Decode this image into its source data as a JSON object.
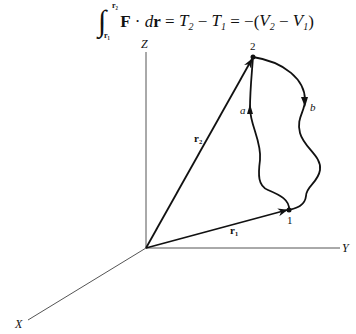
{
  "equation": {
    "integral_symbol": "∫",
    "upper_limit": "r₂",
    "lower_limit": "r₁",
    "integrand_F": "F",
    "dot": " · ",
    "d": "d",
    "integrand_r": "r",
    "eq1": " = ",
    "T2": "T",
    "T2_sub": "2",
    "minus1": " − ",
    "T1": "T",
    "T1_sub": "1",
    "eq2": " = −(",
    "V2": "V",
    "V2_sub": "2",
    "minus2": " − ",
    "V1": "V",
    "V1_sub": "1",
    "close": ")"
  },
  "diagram": {
    "axes": {
      "x_label": "X",
      "y_label": "Y",
      "z_label": "Z"
    },
    "vectors": {
      "r1_label": "r₁",
      "r2_label": "r₂"
    },
    "points": {
      "p1_label": "1",
      "p2_label": "2"
    },
    "paths": {
      "a_label": "a",
      "b_label": "b"
    },
    "colors": {
      "line": "#111111",
      "axis": "#444444",
      "background": "#ffffff"
    }
  }
}
